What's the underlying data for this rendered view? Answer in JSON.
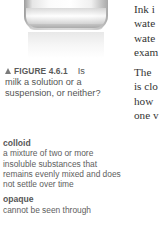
{
  "figure": {
    "image_alt": "glass-of-milk-photo",
    "label": "FIGURE 4.6.1",
    "caption_first": "Is",
    "caption_rest": "milk a solution or a suspension, or neither?"
  },
  "glossary": [
    {
      "term": "colloid",
      "definition": "a mixture of two or more insoluble substances that remains evenly mixed and does not settle over time"
    },
    {
      "term": "opaque",
      "definition": "cannot be seen through"
    }
  ],
  "body": {
    "paragraph1_lines": [
      "Ink i",
      "wate",
      "wate",
      "exam"
    ],
    "paragraph2_lines": [
      "The",
      "is clo",
      "how",
      "one v"
    ]
  }
}
